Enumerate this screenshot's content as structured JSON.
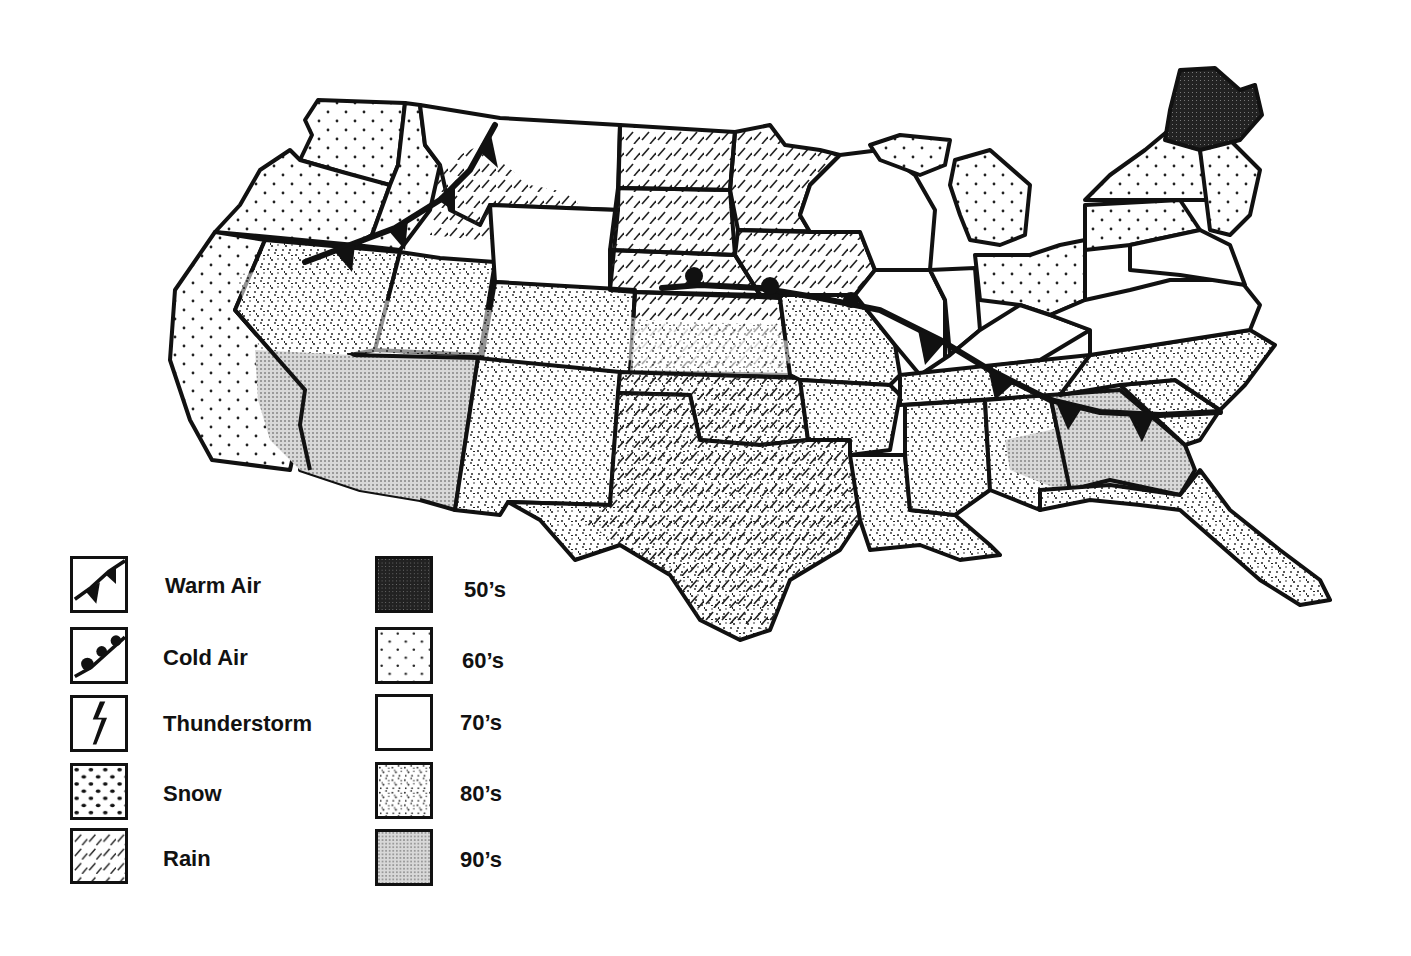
{
  "map": {
    "title": "",
    "region": "Contiguous United States",
    "colors": {
      "ink": "#111111",
      "paper": "#ffffff",
      "fill_90s": "#c8c8c8",
      "fill_50s": "#2a2a2a"
    }
  },
  "legend": {
    "weather": [
      {
        "label": "Warm Air",
        "icon": "warm-front-icon"
      },
      {
        "label": "Cold Air",
        "icon": "cold-front-icon"
      },
      {
        "label": "Thunderstorm",
        "icon": "lightning-bolt-icon"
      },
      {
        "label": "Snow",
        "icon": "snow-pattern-icon"
      },
      {
        "label": "Rain",
        "icon": "rain-hatch-icon"
      }
    ],
    "temperature": [
      {
        "label": "50’s",
        "pattern": "dense-dark"
      },
      {
        "label": "60’s",
        "pattern": "sparse-dots"
      },
      {
        "label": "70’s",
        "pattern": "blank"
      },
      {
        "label": "80’s",
        "pattern": "stipple"
      },
      {
        "label": "90’s",
        "pattern": "fine-grey"
      }
    ]
  },
  "fronts": [
    {
      "type": "warm",
      "location": "Northwest (Oregon/Idaho/Montana)"
    },
    {
      "type": "cold",
      "location": "Central Plains to Southeast (Nebraska to Georgia/South Carolina)"
    }
  ]
}
